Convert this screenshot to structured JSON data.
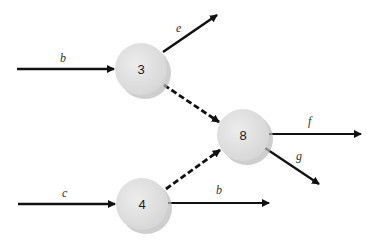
{
  "diagram": {
    "type": "flow-network",
    "nodes": [
      {
        "id": "n3",
        "label": "3",
        "cx": 141,
        "cy": 69,
        "r": 26
      },
      {
        "id": "n8",
        "label": "8",
        "cx": 243,
        "cy": 135,
        "r": 26
      },
      {
        "id": "n4",
        "label": "4",
        "cx": 142,
        "cy": 204,
        "r": 26
      }
    ],
    "edges": [
      {
        "id": "e-b-in",
        "label": "b",
        "from": "source",
        "to": "3",
        "style": "solid"
      },
      {
        "id": "e-e-out",
        "label": "e",
        "from": "3",
        "to": "sink",
        "style": "solid"
      },
      {
        "id": "e-3-8",
        "label": "",
        "from": "3",
        "to": "8",
        "style": "dashed"
      },
      {
        "id": "e-c-in",
        "label": "c",
        "from": "source",
        "to": "4",
        "style": "solid"
      },
      {
        "id": "e-4-8",
        "label": "",
        "from": "4",
        "to": "8",
        "style": "dashed"
      },
      {
        "id": "e-b-out",
        "label": "b",
        "from": "4",
        "to": "sink",
        "style": "solid"
      },
      {
        "id": "e-f-out",
        "label": "f",
        "from": "8",
        "to": "sink",
        "style": "solid"
      },
      {
        "id": "e-g-out",
        "label": "g",
        "from": "8",
        "to": "sink",
        "style": "solid"
      }
    ],
    "colors": {
      "node_fill": "#e2e2e2",
      "node_shadow": "#b9b9b9",
      "edge": "#111111"
    }
  }
}
